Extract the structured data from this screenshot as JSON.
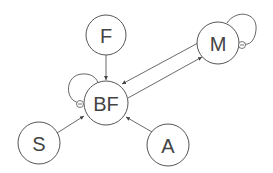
{
  "diagram": {
    "type": "directed-graph",
    "nodes": [
      {
        "id": "F",
        "label": "F",
        "cx": 106,
        "cy": 35,
        "r": 20
      },
      {
        "id": "BF",
        "label": "BF",
        "cx": 106,
        "cy": 103,
        "r": 22
      },
      {
        "id": "M",
        "label": "M",
        "cx": 218,
        "cy": 43,
        "r": 21
      },
      {
        "id": "S",
        "label": "S",
        "cx": 39,
        "cy": 143,
        "r": 21
      },
      {
        "id": "A",
        "label": "A",
        "cx": 168,
        "cy": 145,
        "r": 21
      }
    ],
    "edges": [
      {
        "from": "F",
        "to": "BF"
      },
      {
        "from": "S",
        "to": "BF"
      },
      {
        "from": "A",
        "to": "BF"
      },
      {
        "from": "M",
        "to": "BF"
      },
      {
        "from": "BF",
        "to": "M"
      }
    ],
    "self_loops": [
      {
        "node": "BF",
        "sign": "-"
      },
      {
        "node": "M",
        "sign": "-"
      }
    ]
  }
}
